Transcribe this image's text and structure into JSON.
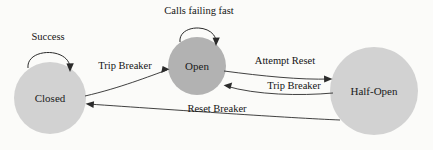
{
  "diagram": {
    "background_color": "#fbfbf9",
    "stroke_color": "#2b2b2b",
    "states": [
      {
        "id": "closed",
        "label": "Closed",
        "cx": 50,
        "cy": 98,
        "r": 36,
        "fill": "#d2d2d2"
      },
      {
        "id": "open",
        "label": "Open",
        "cx": 197,
        "cy": 66,
        "r": 29,
        "fill": "#b2b2b2"
      },
      {
        "id": "half_open",
        "label": "Half-Open",
        "cx": 374,
        "cy": 91,
        "r": 44,
        "fill": "#d2d2d2"
      }
    ],
    "transitions": [
      {
        "id": "closed-self",
        "label": "Success",
        "from": "closed",
        "to": "closed",
        "type": "self-loop",
        "label_x": 48,
        "label_y": 38
      },
      {
        "id": "open-self",
        "label": "Calls failing fast",
        "from": "open",
        "to": "open",
        "type": "self-loop",
        "label_x": 199,
        "label_y": 12
      },
      {
        "id": "closed-to-open",
        "label": "Trip Breaker",
        "from": "closed",
        "to": "open",
        "type": "directed",
        "label_x": 125,
        "label_y": 67
      },
      {
        "id": "open-to-half-open",
        "label": "Attempt Reset",
        "from": "open",
        "to": "half_open",
        "type": "directed",
        "label_x": 285,
        "label_y": 62
      },
      {
        "id": "half-open-to-open",
        "label": "Trip Breaker",
        "from": "half_open",
        "to": "open",
        "type": "directed",
        "label_x": 294,
        "label_y": 87
      },
      {
        "id": "half-open-to-closed",
        "label": "Reset Breaker",
        "from": "half_open",
        "to": "closed",
        "type": "directed",
        "label_x": 217,
        "label_y": 110
      }
    ]
  }
}
